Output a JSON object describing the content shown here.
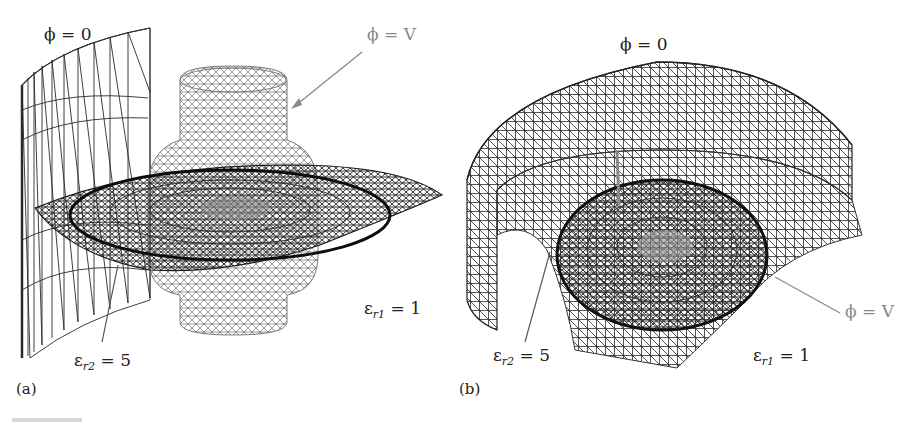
{
  "figure": {
    "panels": [
      {
        "tag": "(a)",
        "labels": {
          "ground_boundary": "ϕ = 0",
          "electrode": "ϕ = V",
          "dielectric_inner_sym": "ε",
          "dielectric_inner_sub": "r2",
          "dielectric_inner_val": " = 5",
          "dielectric_outer_sym": "ε",
          "dielectric_outer_sub": "r1",
          "dielectric_outer_val": " = 1"
        }
      },
      {
        "tag": "(b)",
        "labels": {
          "ground_boundary": "ϕ = 0",
          "electrode": "ϕ = V",
          "dielectric_inner_sym": "ε",
          "dielectric_inner_sub": "r2",
          "dielectric_inner_val": " = 5",
          "dielectric_outer_sym": "ε",
          "dielectric_outer_sub": "r1",
          "dielectric_outer_val": " = 1"
        }
      }
    ],
    "colors": {
      "mesh_dark": "#1a1a1a",
      "mesh_gray": "#7a7a7a",
      "leader_gray": "#8a8a8a",
      "text": "#222222"
    }
  }
}
